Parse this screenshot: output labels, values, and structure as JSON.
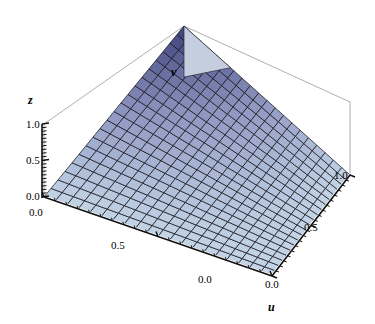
{
  "chart_data": {
    "type": "surface",
    "title": "",
    "xlabel": "u",
    "ylabel": "v",
    "zlabel": "z",
    "xlim": [
      0.0,
      1.0
    ],
    "ylim": [
      0.0,
      1.0
    ],
    "zlim": [
      0.0,
      1.0
    ],
    "grid": true,
    "legend": null,
    "mesh": {
      "u_divisions": 20,
      "v_divisions": 20
    },
    "surface_function": "z = u*v (saddle-free bilinear ramp rising to peak at u=1, v=1)",
    "colormap": {
      "low": "#c3d4e6",
      "mid": "#8e96c0",
      "high": "#3b3f78",
      "backface": "#c5cede"
    },
    "notable_points": [
      {
        "u": 0.0,
        "v": 0.0,
        "z": 0.0
      },
      {
        "u": 1.0,
        "v": 0.0,
        "z": 0.0
      },
      {
        "u": 0.0,
        "v": 1.0,
        "z": 0.0
      },
      {
        "u": 1.0,
        "v": 1.0,
        "z": 1.0
      }
    ],
    "axes": {
      "u_ticks": [
        {
          "value": 0.0,
          "label": "0.0"
        },
        {
          "value": 0.5,
          "label": "0.5"
        },
        {
          "value": 1.0,
          "label": "1.0"
        }
      ],
      "v_ticks": [
        {
          "value": 0.0,
          "label": "0.0"
        },
        {
          "value": 0.5,
          "label": "0.5"
        }
      ],
      "z_ticks": [
        {
          "value": 0.0,
          "label": "0.0"
        },
        {
          "value": 0.5,
          "label": "0.5"
        },
        {
          "value": 1.0,
          "label": "1.0"
        }
      ]
    }
  },
  "labels": {
    "z_axis_name": "z",
    "v_axis_name": "v",
    "u_axis_name": "u",
    "z_tick_1": "1.0",
    "z_tick_2": "0.5",
    "z_tick_3": "0.0",
    "v_tick_0": "0.0",
    "v_tick_1": "0.5",
    "v_tick_2": "0.0",
    "u_tick_0": "0.0",
    "u_tick_1": "0.5",
    "u_tick_2": "1.0"
  }
}
